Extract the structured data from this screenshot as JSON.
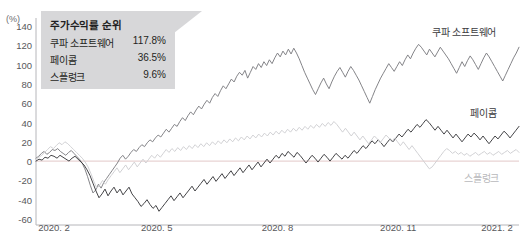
{
  "header": {
    "cut_title": "",
    "cut_title_right": ""
  },
  "axis": {
    "unit_label": "(%)",
    "y_ticks": [
      140,
      120,
      100,
      80,
      60,
      40,
      20,
      0,
      -20,
      -40,
      -60
    ],
    "x_ticks": [
      "2020. 2",
      "2020. 5",
      "2020. 8",
      "2020. 11",
      "2021. 2"
    ]
  },
  "legend": {
    "title": "주가수익률 순위",
    "rows": [
      {
        "name": "쿠파 소프트웨어",
        "value": "117.8%"
      },
      {
        "name": "페이콤",
        "value": "36.5%"
      },
      {
        "name": "스플렁크",
        "value": "9.6%"
      }
    ]
  },
  "series_labels": [
    {
      "text": "쿠파 소프트웨어",
      "color": "#3b3b3e"
    },
    {
      "text": "페이콤",
      "color": "#3b3b3e"
    },
    {
      "text": "스플렁크",
      "color": "#b9b9bc"
    }
  ],
  "colors": {
    "coupa": "#7d7d82",
    "paycom": "#3a3a3d",
    "splunk": "#cfcfd2",
    "axis": "#b6b6ba",
    "zero_line": "#e8d3d3",
    "legend_bg": "#d7d7d9",
    "text": "#58585b"
  },
  "chart_data": {
    "type": "line",
    "title": "주가수익률 순위",
    "xlabel": "",
    "ylabel": "(%)",
    "ylim": [
      -60,
      140
    ],
    "xlim": [
      "2020. 2",
      "2021. 2"
    ],
    "grid": false,
    "legend_position": "inline-right",
    "x_tick_labels": [
      "2020. 2",
      "2020. 5",
      "2020. 8",
      "2020. 11",
      "2021. 2"
    ],
    "y_tick_values": [
      140,
      120,
      100,
      80,
      60,
      40,
      20,
      0,
      -20,
      -40,
      -60
    ],
    "final_values": {
      "쿠파 소프트웨어": 117.8,
      "페이콤": 36.5,
      "스플렁크": 9.6
    },
    "series": [
      {
        "name": "쿠파 소프트웨어",
        "color": "#7d7d82",
        "values": [
          3,
          5,
          8,
          10,
          7,
          9,
          12,
          11,
          13,
          10,
          8,
          6,
          9,
          11,
          8,
          5,
          2,
          -2,
          -8,
          -16,
          -25,
          -33,
          -30,
          -24,
          -28,
          -22,
          -18,
          -14,
          -10,
          -6,
          -2,
          3,
          6,
          2,
          5,
          9,
          12,
          10,
          14,
          17,
          15,
          19,
          22,
          20,
          24,
          27,
          25,
          29,
          33,
          30,
          34,
          38,
          36,
          41,
          45,
          42,
          47,
          51,
          48,
          53,
          57,
          54,
          59,
          63,
          60,
          66,
          70,
          67,
          73,
          78,
          75,
          80,
          85,
          82,
          88,
          92,
          89,
          94,
          86,
          92,
          98,
          95,
          101,
          97,
          103,
          99,
          105,
          101,
          107,
          112,
          108,
          114,
          110,
          116,
          111,
          117,
          112,
          106,
          99,
          92,
          86,
          80,
          74,
          69,
          75,
          81,
          86,
          80,
          75,
          82,
          88,
          93,
          97,
          92,
          87,
          93,
          98,
          94,
          89,
          84,
          78,
          72,
          66,
          60,
          67,
          74,
          80,
          86,
          91,
          96,
          101,
          97,
          93,
          98,
          103,
          99,
          105,
          110,
          106,
          112,
          117,
          121,
          118,
          114,
          110,
          116,
          112,
          108,
          113,
          118,
          114,
          110,
          106,
          101,
          96,
          91,
          97,
          103,
          98,
          104,
          109,
          105,
          100,
          95,
          101,
          107,
          112,
          108,
          103,
          98,
          93,
          88,
          83,
          89,
          95,
          101,
          107,
          112,
          118
        ]
      },
      {
        "name": "페이콤",
        "color": "#3a3a3d",
        "values": [
          0,
          2,
          1,
          4,
          3,
          6,
          5,
          3,
          6,
          4,
          2,
          0,
          3,
          5,
          2,
          -1,
          -4,
          -9,
          -15,
          -23,
          -31,
          -38,
          -34,
          -29,
          -36,
          -31,
          -27,
          -33,
          -29,
          -35,
          -31,
          -27,
          -34,
          -38,
          -42,
          -47,
          -44,
          -40,
          -45,
          -49,
          -46,
          -52,
          -48,
          -44,
          -40,
          -36,
          -41,
          -37,
          -33,
          -38,
          -34,
          -30,
          -26,
          -31,
          -27,
          -23,
          -19,
          -24,
          -20,
          -16,
          -21,
          -17,
          -13,
          -18,
          -14,
          -10,
          -15,
          -11,
          -7,
          -12,
          -8,
          -4,
          -9,
          -5,
          -1,
          -6,
          -2,
          2,
          -2,
          2,
          6,
          3,
          8,
          5,
          10,
          7,
          4,
          9,
          6,
          2,
          -2,
          2,
          6,
          3,
          -1,
          3,
          7,
          4,
          0,
          4,
          8,
          5,
          2,
          6,
          3,
          7,
          11,
          8,
          12,
          16,
          13,
          17,
          21,
          18,
          22,
          19,
          15,
          19,
          23,
          20,
          24,
          28,
          25,
          29,
          33,
          30,
          34,
          38,
          35,
          39,
          43,
          40,
          36,
          32,
          36,
          32,
          28,
          32,
          28,
          24,
          28,
          24,
          20,
          24,
          28,
          25,
          29,
          26,
          22,
          26,
          22,
          18,
          22,
          26,
          23,
          27,
          31,
          28,
          24,
          28,
          32,
          36
        ]
      },
      {
        "name": "스플렁크",
        "color": "#cfcfd2",
        "values": [
          2,
          4,
          6,
          9,
          12,
          15,
          13,
          16,
          19,
          17,
          20,
          18,
          15,
          12,
          9,
          6,
          3,
          -1,
          -6,
          -13,
          -21,
          -28,
          -25,
          -20,
          -24,
          -19,
          -15,
          -11,
          -7,
          -12,
          -8,
          -4,
          -9,
          -5,
          -1,
          -6,
          -2,
          2,
          -2,
          2,
          6,
          3,
          7,
          4,
          8,
          12,
          9,
          13,
          10,
          14,
          11,
          15,
          12,
          16,
          13,
          17,
          14,
          18,
          15,
          19,
          16,
          20,
          17,
          21,
          18,
          22,
          19,
          23,
          20,
          24,
          21,
          25,
          22,
          26,
          23,
          27,
          24,
          28,
          25,
          29,
          26,
          30,
          27,
          31,
          28,
          32,
          29,
          33,
          30,
          34,
          31,
          35,
          32,
          36,
          33,
          37,
          34,
          38,
          35,
          39,
          36,
          40,
          37,
          41,
          38,
          34,
          30,
          34,
          30,
          26,
          30,
          26,
          22,
          26,
          22,
          18,
          22,
          26,
          23,
          19,
          23,
          27,
          24,
          20,
          24,
          20,
          16,
          20,
          16,
          12,
          16,
          12,
          8,
          4,
          0,
          -4,
          -8,
          -6,
          -2,
          2,
          6,
          10,
          13,
          11,
          8,
          10,
          7,
          9,
          6,
          8,
          5,
          7,
          9,
          6,
          8,
          10,
          7,
          9,
          6,
          8,
          10,
          7,
          9,
          11,
          8,
          10,
          12,
          9
        ]
      }
    ]
  }
}
